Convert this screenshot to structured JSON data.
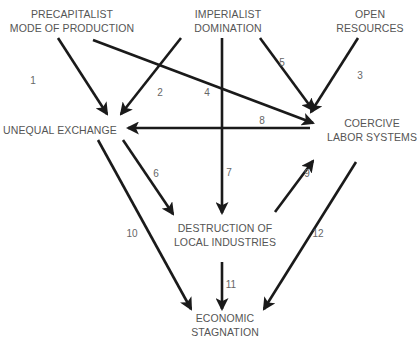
{
  "diagram": {
    "type": "causal-flow",
    "nodes": [
      {
        "id": "precapitalist",
        "lines": [
          "PRECAPITALIST",
          "MODE OF PRODUCTION"
        ],
        "x": 72,
        "y": 7
      },
      {
        "id": "imperialist",
        "lines": [
          "IMPERIALIST",
          "DOMINATION"
        ],
        "x": 228,
        "y": 7
      },
      {
        "id": "open_resources",
        "lines": [
          "OPEN",
          "RESOURCES"
        ],
        "x": 370,
        "y": 7
      },
      {
        "id": "unequal_exchange",
        "lines": [
          "UNEQUAL EXCHANGE"
        ],
        "x": 60,
        "y": 123
      },
      {
        "id": "coercive_labor",
        "lines": [
          "COERCIVE",
          "LABOR SYSTEMS"
        ],
        "x": 372,
        "y": 116
      },
      {
        "id": "destruction",
        "lines": [
          "DESTRUCTION OF",
          "LOCAL INDUSTRIES"
        ],
        "x": 225,
        "y": 221
      },
      {
        "id": "stagnation",
        "lines": [
          "ECONOMIC",
          "STAGNATION"
        ],
        "x": 225,
        "y": 311
      }
    ],
    "edges": [
      {
        "label": "1",
        "from": "precapitalist",
        "to": "unequal_exchange",
        "x1": 58,
        "y1": 38,
        "x2": 107,
        "y2": 114,
        "lx": 33,
        "ly": 81
      },
      {
        "label": "2",
        "from": "imperialist",
        "to": "unequal_exchange",
        "x1": 181,
        "y1": 38,
        "x2": 121,
        "y2": 114,
        "lx": 160,
        "ly": 93
      },
      {
        "label": "3",
        "from": "open_resources",
        "to": "coercive_labor",
        "x1": 358,
        "y1": 38,
        "x2": 311,
        "y2": 112,
        "lx": 360,
        "ly": 76
      },
      {
        "label": "4",
        "from": "precapitalist",
        "to": "coercive_labor",
        "x1": 93,
        "y1": 40,
        "x2": 313,
        "y2": 123,
        "lx": 207,
        "ly": 93
      },
      {
        "label": "5",
        "from": "imperialist",
        "to": "coercive_labor",
        "x1": 260,
        "y1": 38,
        "x2": 313,
        "y2": 110,
        "lx": 282,
        "ly": 63
      },
      {
        "label": "6",
        "from": "unequal_exchange",
        "to": "destruction",
        "x1": 123,
        "y1": 140,
        "x2": 173,
        "y2": 214,
        "lx": 156,
        "ly": 174
      },
      {
        "label": "7",
        "from": "imperialist",
        "to": "destruction",
        "x1": 222,
        "y1": 38,
        "x2": 222,
        "y2": 213,
        "lx": 229,
        "ly": 173
      },
      {
        "label": "8",
        "from": "coercive_labor",
        "to": "unequal_exchange",
        "x1": 310,
        "y1": 128,
        "x2": 128,
        "y2": 128,
        "lx": 262,
        "ly": 121
      },
      {
        "label": "9",
        "from": "destruction",
        "to": "coercive_labor",
        "x1": 275,
        "y1": 212,
        "x2": 313,
        "y2": 161,
        "lx": 307,
        "ly": 174
      },
      {
        "label": "10",
        "from": "unequal_exchange",
        "to": "stagnation",
        "x1": 98,
        "y1": 140,
        "x2": 191,
        "y2": 309,
        "lx": 132,
        "ly": 234
      },
      {
        "label": "11",
        "from": "destruction",
        "to": "stagnation",
        "x1": 222,
        "y1": 262,
        "x2": 222,
        "y2": 309,
        "lx": 231,
        "ly": 285
      },
      {
        "label": "12",
        "from": "coercive_labor",
        "to": "stagnation",
        "x1": 356,
        "y1": 162,
        "x2": 264,
        "y2": 309,
        "lx": 318,
        "ly": 234
      }
    ],
    "colors": {
      "line": "#1a1a1a",
      "node_text": "#555555",
      "edge_label": "#666666",
      "background": "#ffffff"
    }
  }
}
